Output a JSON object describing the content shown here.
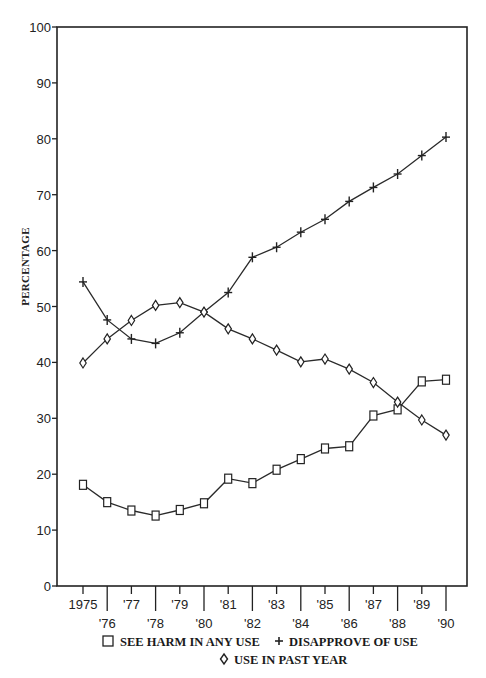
{
  "chart_data": {
    "type": "line",
    "title": "",
    "xlabel": "",
    "ylabel": "PERCENTAGE",
    "ylim": [
      0,
      100
    ],
    "yticks": [
      0,
      10,
      20,
      30,
      40,
      50,
      60,
      70,
      80,
      90,
      100
    ],
    "grid": false,
    "legend_position": "bottom",
    "categories": [
      "1975",
      "'76",
      "'77",
      "'78",
      "'79",
      "'80",
      "'81",
      "'82",
      "'83",
      "'84",
      "'85",
      "'86",
      "'87",
      "'88",
      "'89",
      "'90"
    ],
    "x": [
      1975,
      1976,
      1977,
      1978,
      1979,
      1980,
      1981,
      1982,
      1983,
      1984,
      1985,
      1986,
      1987,
      1988,
      1989,
      1990
    ],
    "series": [
      {
        "name": "SEE HARM IN ANY USE",
        "marker": "square",
        "values": [
          18.1,
          15.0,
          13.5,
          12.6,
          13.6,
          14.8,
          19.2,
          18.4,
          20.8,
          22.7,
          24.6,
          25.0,
          30.5,
          31.6,
          36.6,
          36.9
        ]
      },
      {
        "name": "DISAPPROVE OF USE",
        "marker": "plus",
        "values": [
          54.4,
          47.6,
          44.2,
          43.4,
          45.3,
          49.0,
          52.5,
          58.8,
          60.6,
          63.3,
          65.6,
          68.8,
          71.3,
          73.7,
          77.0,
          80.3
        ]
      },
      {
        "name": "USE IN PAST YEAR",
        "marker": "diamond",
        "values": [
          39.9,
          44.2,
          47.5,
          50.2,
          50.7,
          49.0,
          46.0,
          44.2,
          42.2,
          40.1,
          40.6,
          38.8,
          36.4,
          32.9,
          29.7,
          27.0
        ]
      }
    ]
  },
  "legend": {
    "line1": [
      {
        "symbol": "square",
        "label": "SEE HARM IN ANY USE"
      },
      {
        "symbol": "plus",
        "label": "DISAPPROVE OF USE"
      }
    ],
    "line2": [
      {
        "symbol": "diamond",
        "label": "USE IN PAST YEAR"
      }
    ]
  },
  "colors": {
    "ink": "#222222",
    "background": "#ffffff"
  }
}
